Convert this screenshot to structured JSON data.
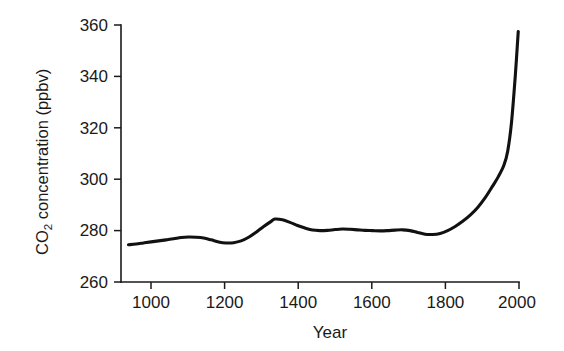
{
  "chart_data": {
    "type": "line",
    "title": "",
    "xlabel": "Year",
    "ylabel": "CO2 concentration (ppbv)",
    "ylabel_prefix": "CO",
    "ylabel_subscript": "2",
    "ylabel_suffix": " concentration (ppbv)",
    "xlim": [
      940,
      2000
    ],
    "ylim": [
      260,
      360
    ],
    "xticks": [
      1000,
      1200,
      1400,
      1600,
      1800,
      2000
    ],
    "xtick_labels": [
      "1000",
      "1200",
      "1400",
      "1600",
      "1800",
      "2000"
    ],
    "yticks": [
      260,
      280,
      300,
      320,
      340,
      360
    ],
    "ytick_labels": [
      "260",
      "280",
      "300",
      "320",
      "340",
      "360"
    ],
    "grid": false,
    "legend": false,
    "line_color": "#111111",
    "axis_color": "#1a1a1a",
    "background_color": "#ffffff",
    "series": [
      {
        "name": "Atmospheric CO2 concentration",
        "x": [
          960,
          980,
          1000,
          1020,
          1040,
          1060,
          1080,
          1100,
          1120,
          1140,
          1160,
          1180,
          1200,
          1220,
          1240,
          1260,
          1280,
          1300,
          1320,
          1340,
          1350,
          1370,
          1390,
          1410,
          1430,
          1450,
          1470,
          1490,
          1510,
          1530,
          1550,
          1570,
          1590,
          1610,
          1630,
          1650,
          1670,
          1690,
          1710,
          1730,
          1750,
          1770,
          1790,
          1810,
          1830,
          1850,
          1870,
          1890,
          1910,
          1930,
          1945,
          1960,
          1970,
          1980,
          1990,
          1998
        ],
        "y": [
          274.5,
          274.8,
          275.2,
          275.6,
          276.0,
          276.4,
          276.8,
          277.3,
          277.5,
          277.4,
          277.1,
          276.4,
          275.6,
          275.2,
          275.3,
          276.0,
          277.4,
          279.4,
          281.6,
          283.6,
          284.5,
          284.2,
          283.2,
          282.0,
          281.0,
          280.2,
          280.0,
          280.1,
          280.4,
          280.6,
          280.5,
          280.3,
          280.1,
          280.0,
          279.9,
          280.0,
          280.2,
          280.3,
          280.0,
          279.3,
          278.6,
          278.5,
          278.9,
          280.0,
          281.6,
          283.6,
          286.0,
          289.0,
          292.8,
          297.4,
          301.0,
          305.5,
          311.0,
          322.0,
          340.0,
          357.5
        ]
      }
    ]
  },
  "axes": {
    "x_axis_name": "year-axis",
    "y_axis_name": "co2-concentration-axis"
  }
}
